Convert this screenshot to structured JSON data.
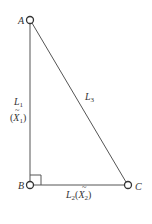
{
  "diagram": {
    "type": "right-triangle",
    "colors": {
      "stroke": "#555555",
      "text": "#333333",
      "background": "#ffffff"
    },
    "vertices": [
      {
        "id": "A",
        "label": "A",
        "x": 30,
        "y": 20
      },
      {
        "id": "B",
        "label": "B",
        "x": 30,
        "y": 185
      },
      {
        "id": "C",
        "label": "C",
        "x": 128,
        "y": 185
      }
    ],
    "edges": [
      {
        "from": "A",
        "to": "B",
        "label": "L1",
        "sublabel": "(X̃1)"
      },
      {
        "from": "B",
        "to": "C",
        "label": "L2(X̃2)"
      },
      {
        "from": "A",
        "to": "C",
        "label": "L3"
      }
    ],
    "right_angle_at": "B",
    "labels": {
      "a": "A",
      "b": "B",
      "c": "C",
      "l1_main": "L",
      "l1_sub": "1",
      "l1_paren_open": "(",
      "l1_x": "X",
      "l1_x_sub": "1",
      "l1_paren_close": ")",
      "l2_main": "L",
      "l2_sub": "2",
      "l2_paren_open": "(",
      "l2_x": "X",
      "l2_x_sub": "2",
      "l2_paren_close": ")",
      "l3_main": "L",
      "l3_sub": "3",
      "tilde": "~"
    }
  }
}
